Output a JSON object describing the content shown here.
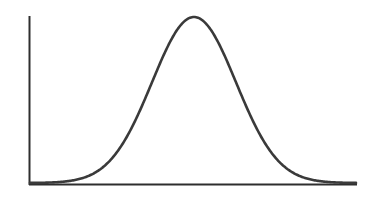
{
  "chart_data": {
    "type": "line",
    "title": "",
    "xlabel": "",
    "ylabel": "",
    "series": [
      {
        "name": "density",
        "distribution": "normal",
        "mean": 0,
        "std": 1,
        "x": [
          -4,
          -3.5,
          -3,
          -2.5,
          -2,
          -1.5,
          -1,
          -0.5,
          0,
          0.5,
          1,
          1.5,
          2,
          2.5,
          3,
          3.5,
          4
        ],
        "values": [
          0.0001,
          0.0009,
          0.0044,
          0.0175,
          0.054,
          0.1295,
          0.242,
          0.3521,
          0.3989,
          0.3521,
          0.242,
          0.1295,
          0.054,
          0.0175,
          0.0044,
          0.0009,
          0.0001
        ]
      }
    ],
    "xlim": [
      -4,
      4
    ],
    "ylim": [
      0,
      0.4
    ],
    "grid": false,
    "legend": null,
    "ticks": false,
    "colors": {
      "curve": "#3a3a3a",
      "axes": "#2e2e2e",
      "background": "#ffffff"
    }
  }
}
